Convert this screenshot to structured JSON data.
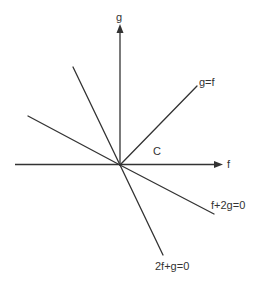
{
  "diagram": {
    "axes": {
      "horizontal_label": "f",
      "vertical_label": "g"
    },
    "region_label": "C",
    "lines": [
      {
        "name": "g=f",
        "label": "g=f"
      },
      {
        "name": "f+2g=0",
        "label": "f+2g=0"
      },
      {
        "name": "2f+g=0",
        "label": "2f+g=0"
      },
      {
        "name": "upper-left-steep",
        "label": ""
      },
      {
        "name": "upper-left-shallow",
        "label": ""
      }
    ],
    "colors": {
      "ink": "#333333",
      "background": "#ffffff"
    }
  }
}
